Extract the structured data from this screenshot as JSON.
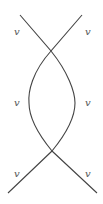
{
  "diagram": {
    "type": "braid-crossing",
    "stroke_color": "#444444",
    "labels": [
      {
        "id": "top-left",
        "text": "v",
        "x": 14,
        "y": 35
      },
      {
        "id": "top-right",
        "text": "v",
        "x": 85,
        "y": 35
      },
      {
        "id": "mid-left",
        "text": "v",
        "x": 14,
        "y": 106
      },
      {
        "id": "mid-right",
        "text": "v",
        "x": 85,
        "y": 106
      },
      {
        "id": "bottom-left",
        "text": "v",
        "x": 14,
        "y": 177
      },
      {
        "id": "bottom-right",
        "text": "v",
        "x": 85,
        "y": 177
      }
    ],
    "strands": [
      {
        "id": "strand-a",
        "d": "M 20 15 L 51 51 C 32 72, 28 92, 29 103 C 29 118, 38 134, 52 151 L 97 193"
      },
      {
        "id": "strand-b",
        "d": "M 82 15 L 51 51 C 68 72, 75 92, 75 103 C 75 118, 66 134, 52 151 L 8 193"
      }
    ]
  }
}
